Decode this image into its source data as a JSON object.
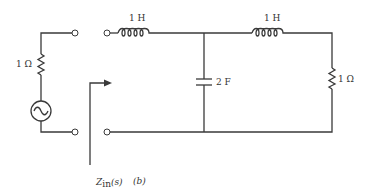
{
  "figure": {
    "caption": "(b)",
    "colors": {
      "line": "#3a3a3a",
      "text": "#333333",
      "background": "#ffffff"
    }
  },
  "source_branch": {
    "resistor_label": "1 Ω",
    "source_type": "ac-voltage-source"
  },
  "network": {
    "inductor_1_label": "1 H",
    "capacitor_label": "2 F",
    "inductor_2_label": "1 H",
    "load_resistor_label": "1 Ω"
  },
  "impedance_marker": {
    "label_main": "Z",
    "label_sub": "in",
    "label_arg": "(s)"
  }
}
